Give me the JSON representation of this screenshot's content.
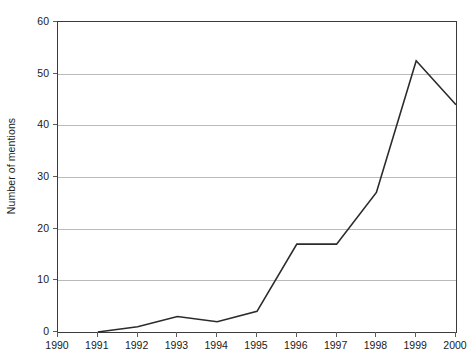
{
  "chart_data": {
    "type": "line",
    "title": "",
    "xlabel": "",
    "ylabel": "Number of mentions",
    "categories": [
      "1990",
      "1991",
      "1992",
      "1993",
      "1994",
      "1995",
      "1996",
      "1997",
      "1998",
      "1999",
      "2000"
    ],
    "x": [
      1990,
      1991,
      1992,
      1993,
      1994,
      1995,
      1996,
      1997,
      1998,
      1999,
      2000
    ],
    "values": [
      null,
      0,
      1,
      3,
      2,
      4,
      17,
      17,
      27,
      52.5,
      44
    ],
    "series": [
      {
        "name": "Number of mentions",
        "points": [
          {
            "x": 1991,
            "y": 0
          },
          {
            "x": 1992,
            "y": 1
          },
          {
            "x": 1993,
            "y": 3
          },
          {
            "x": 1994,
            "y": 2
          },
          {
            "x": 1995,
            "y": 4
          },
          {
            "x": 1996,
            "y": 17
          },
          {
            "x": 1997,
            "y": 17
          },
          {
            "x": 1998,
            "y": 27
          },
          {
            "x": 1999,
            "y": 52.5
          },
          {
            "x": 2000,
            "y": 44
          }
        ],
        "color": "#2b2b2b"
      }
    ],
    "xlim": [
      1990,
      2000
    ],
    "ylim": [
      0,
      60
    ],
    "yticks": [
      0,
      10,
      20,
      30,
      40,
      50,
      60
    ],
    "ytick_labels": [
      "0",
      "10",
      "20",
      "30",
      "40",
      "50",
      "60"
    ],
    "xticks": [
      1990,
      1991,
      1992,
      1993,
      1994,
      1995,
      1996,
      1997,
      1998,
      1999,
      2000
    ],
    "xtick_labels": [
      "1990",
      "1991",
      "1992",
      "1993",
      "1994",
      "1995",
      "1996",
      "1997",
      "1998",
      "1999",
      "2000"
    ],
    "grid": "horizontal",
    "grid_color": "#b9b9b9",
    "legend": "none",
    "frame_color": "#3a3a3a",
    "background": "#ffffff"
  }
}
